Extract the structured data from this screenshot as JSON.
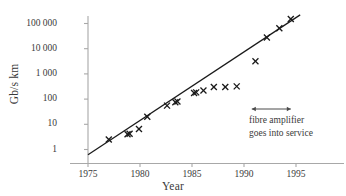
{
  "chart_data": {
    "type": "scatter",
    "title": "",
    "xlabel": "Year",
    "ylabel": "Gb/s km",
    "xlim": [
      1974,
      1996
    ],
    "ylim": [
      0.55,
      300000
    ],
    "yscale": "log",
    "xticks": [
      1975,
      1980,
      1985,
      1990,
      1995
    ],
    "xtick_labels": [
      "1975",
      "1980",
      "1985",
      "1990",
      "1995"
    ],
    "yticks": [
      1,
      10,
      100,
      1000,
      10000,
      100000
    ],
    "ytick_labels": [
      "1",
      "10",
      "100",
      "1 000",
      "10 000",
      "100 000"
    ],
    "grid": false,
    "legend": false,
    "marker": "x",
    "series": [
      {
        "name": "system capacity",
        "marker": "x",
        "color": "#1a1a1a",
        "points": [
          {
            "x": 1977.0,
            "y": 2.5
          },
          {
            "x": 1978.8,
            "y": 4.0
          },
          {
            "x": 1979.0,
            "y": 4.2
          },
          {
            "x": 1979.9,
            "y": 6.5
          },
          {
            "x": 1980.7,
            "y": 20.0
          },
          {
            "x": 1982.6,
            "y": 55.0
          },
          {
            "x": 1983.4,
            "y": 75.0
          },
          {
            "x": 1983.6,
            "y": 80.0
          },
          {
            "x": 1985.2,
            "y": 175.0
          },
          {
            "x": 1985.4,
            "y": 185.0
          },
          {
            "x": 1986.1,
            "y": 220.0
          },
          {
            "x": 1987.1,
            "y": 300.0
          },
          {
            "x": 1988.2,
            "y": 300.0
          },
          {
            "x": 1989.3,
            "y": 320.0
          },
          {
            "x": 1991.1,
            "y": 3200.0
          },
          {
            "x": 1992.2,
            "y": 28000.0
          },
          {
            "x": 1993.4,
            "y": 65000.0
          },
          {
            "x": 1994.5,
            "y": 150000.0
          }
        ]
      }
    ],
    "trendline": {
      "name": "exponential fit",
      "color": "#1a1a1a",
      "x_start": 1975.0,
      "y_start": 0.62,
      "x_end": 1995.4,
      "y_end": 220000.0
    },
    "annotations": [
      {
        "name": "fibre-amplifier-marker",
        "type": "double-arrow-with-label",
        "x_start": 1990.75,
        "x_end": 1994.5,
        "text_line1": "fibre amplifier",
        "text_line2": "goes into service"
      }
    ]
  },
  "axis": {
    "ylabel": "Gb/s km",
    "xlabel": "Year"
  },
  "annotation": {
    "line1": "fibre amplifier",
    "line2": "goes into service"
  },
  "colors": {
    "axis": "#a8a8a8",
    "marker": "#1a1a1a",
    "trendline": "#1a1a1a",
    "text": "#3a3a3a",
    "background": "#ffffff"
  }
}
